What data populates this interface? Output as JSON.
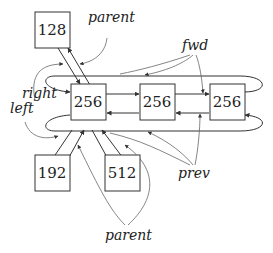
{
  "diagram": {
    "nodes": [
      {
        "id": "root",
        "label": "128"
      },
      {
        "id": "center",
        "label": "256"
      },
      {
        "id": "dup1",
        "label": "256"
      },
      {
        "id": "dup2",
        "label": "256"
      },
      {
        "id": "left_child",
        "label": "192"
      },
      {
        "id": "right_child",
        "label": "512"
      }
    ],
    "labels": {
      "parent_top": "parent",
      "fwd": "fwd",
      "right": "right",
      "left": "left",
      "prev": "prev",
      "parent_bottom": "parent"
    },
    "colors": {
      "stroke": "#333333",
      "annotation": "#666666",
      "text": "#222222"
    }
  }
}
